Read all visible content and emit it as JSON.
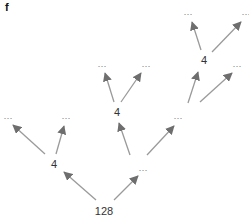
{
  "panel_label": "f",
  "colors": {
    "edge": "#9a9a9a",
    "arrowhead": "#6e6e6e",
    "text": "#333333"
  },
  "nodes": [
    {
      "id": "root",
      "label": "128",
      "x": 104,
      "y": 211
    },
    {
      "id": "a",
      "label": "4",
      "x": 54,
      "y": 164
    },
    {
      "id": "a1",
      "label": "···",
      "x": 8,
      "y": 118
    },
    {
      "id": "a2",
      "label": "···",
      "x": 66,
      "y": 118
    },
    {
      "id": "b",
      "label": "···",
      "x": 143,
      "y": 170
    },
    {
      "id": "c",
      "label": "4",
      "x": 117,
      "y": 112
    },
    {
      "id": "c1",
      "label": "···",
      "x": 102,
      "y": 66
    },
    {
      "id": "c2",
      "label": "···",
      "x": 146,
      "y": 66
    },
    {
      "id": "d",
      "label": "···",
      "x": 178,
      "y": 118
    },
    {
      "id": "e",
      "label": "4",
      "x": 204,
      "y": 60
    },
    {
      "id": "e1",
      "label": "···",
      "x": 188,
      "y": 14
    },
    {
      "id": "e2",
      "label": "···",
      "x": 246,
      "y": 14
    },
    {
      "id": "d2",
      "label": "···",
      "x": 237,
      "y": 66
    }
  ],
  "edges": [
    {
      "from": "root",
      "to": "a",
      "x1": 96,
      "y1": 200,
      "x2": 64,
      "y2": 172
    },
    {
      "from": "root",
      "to": "b",
      "x1": 114,
      "y1": 200,
      "x2": 138,
      "y2": 176
    },
    {
      "from": "a",
      "to": "a1",
      "x1": 45,
      "y1": 154,
      "x2": 13,
      "y2": 125
    },
    {
      "from": "a",
      "to": "a2",
      "x1": 56,
      "y1": 154,
      "x2": 64,
      "y2": 126
    },
    {
      "from": "b",
      "to": "c",
      "x1": 130,
      "y1": 155,
      "x2": 119,
      "y2": 123
    },
    {
      "from": "b",
      "to": "d",
      "x1": 147,
      "y1": 155,
      "x2": 174,
      "y2": 126
    },
    {
      "from": "c",
      "to": "c1",
      "x1": 114,
      "y1": 102,
      "x2": 105,
      "y2": 73
    },
    {
      "from": "c",
      "to": "c2",
      "x1": 121,
      "y1": 102,
      "x2": 141,
      "y2": 73
    },
    {
      "from": "d",
      "to": "e",
      "x1": 188,
      "y1": 103,
      "x2": 198,
      "y2": 72
    },
    {
      "from": "d",
      "to": "d2",
      "x1": 200,
      "y1": 102,
      "x2": 232,
      "y2": 73
    },
    {
      "from": "e",
      "to": "e1",
      "x1": 201,
      "y1": 50,
      "x2": 192,
      "y2": 22
    },
    {
      "from": "e",
      "to": "e2",
      "x1": 212,
      "y1": 52,
      "x2": 241,
      "y2": 22
    }
  ]
}
